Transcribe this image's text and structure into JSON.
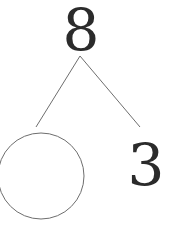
{
  "diagram": {
    "type": "number-bond",
    "whole": "8",
    "parts": [
      {
        "position": "left",
        "value": "",
        "empty_circle": true
      },
      {
        "position": "right",
        "value": "3"
      }
    ],
    "colors": {
      "line": "#6e6e6e",
      "text": "#2b2b2b",
      "background": "#ffffff"
    }
  }
}
